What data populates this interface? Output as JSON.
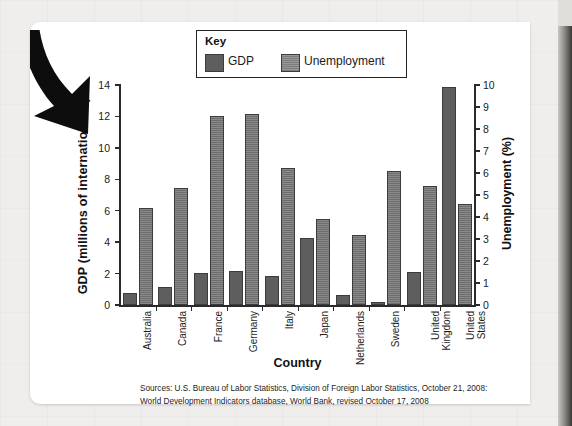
{
  "figure": {
    "legend_title": "Key",
    "source_lines": [
      "Sources: U.S. Bureau of Labor Statistics, Division of Foreign Labor Statistics, October 21, 2008:",
      "World Development Indicators database, World Bank, revised October 17, 2008"
    ]
  },
  "chart_data": {
    "type": "bar",
    "title": "",
    "xlabel": "Country",
    "ylabel": "GDP (millions of international $)",
    "y2label": "Unemployment (%)",
    "ylim": [
      0,
      14
    ],
    "y2lim": [
      0,
      10
    ],
    "yticks": [
      "0",
      "2",
      "4",
      "6",
      "8",
      "10",
      "12",
      "14"
    ],
    "ytick_values": [
      0,
      2,
      4,
      6,
      8,
      10,
      12,
      14
    ],
    "y2ticks": [
      "0",
      "1",
      "2",
      "3",
      "4",
      "5",
      "6",
      "7",
      "8",
      "9",
      "10"
    ],
    "y2tick_values": [
      0,
      1,
      2,
      3,
      4,
      5,
      6,
      7,
      8,
      9,
      10
    ],
    "grid": false,
    "legend_position": "top-center",
    "categories": [
      "Australia",
      "Canada",
      "France",
      "Germany",
      "Italy",
      "Japan",
      "Netherlands",
      "Sweden",
      "United Kingdom",
      "United States"
    ],
    "series": [
      {
        "name": "GDP",
        "axis": "left",
        "units": "millions of international $",
        "color": "#5e5e5e",
        "values": [
          0.75,
          1.15,
          2.05,
          2.15,
          1.85,
          4.25,
          0.65,
          0.2,
          2.1,
          13.85
        ]
      },
      {
        "name": "Unemployment",
        "axis": "right",
        "units": "%",
        "color": "#6d6d6d",
        "values": [
          4.4,
          5.3,
          8.6,
          8.7,
          6.25,
          3.9,
          3.2,
          6.1,
          5.4,
          4.6
        ]
      }
    ]
  }
}
